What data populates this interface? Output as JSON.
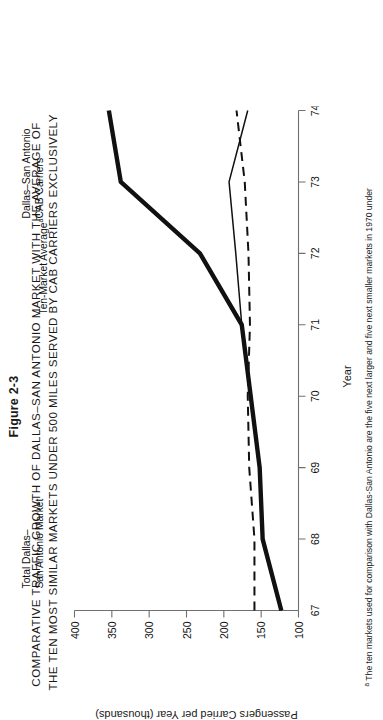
{
  "figure": {
    "number": "Figure 2-3",
    "title_lines": [
      "COMPARATIVE  TRAFFIC  GROWTH  OF  DALLAS–SAN ANTONIO  MARKET  WITH  THE  AVERAGE  OF",
      "THE TEN MOST SIMILAR  MARKETS  UNDER 500 MILES  SERVED  BY  CAB  CARRIERS  EXCLUSIVELY"
    ],
    "footnote_marker": "a",
    "footnote_text": " The ten markets used for comparison with Dallas-San Antonio are the five next larger and five next smaller markets in 1970 under"
  },
  "axes": {
    "x_title": "Year",
    "y_title": "Passengers Carried per Year (thousands)",
    "x_ticks": [
      "67",
      "68",
      "69",
      "70",
      "71",
      "72",
      "73",
      "74"
    ],
    "y_ticks": [
      "100",
      "150",
      "200",
      "250",
      "300",
      "350",
      "400"
    ]
  },
  "series_labels": {
    "total_market": "Total Dallas–\nSan Antonio Market",
    "total_market_l1": "Total Dallas–",
    "total_market_l2": "San Antonio Market",
    "ten_market_l1": "Ten-Market Average",
    "ten_market_sup": "a",
    "cab_l1": "Dallas–San Antonio",
    "cab_l2": "CAB Carriers"
  },
  "colors": {
    "ink": "#111111",
    "axis": "#6f6f6f",
    "background": "#ffffff"
  },
  "chart_data": {
    "type": "line",
    "title": "COMPARATIVE TRAFFIC GROWTH OF DALLAS–SAN ANTONIO MARKET WITH THE AVERAGE OF THE TEN MOST SIMILAR MARKETS UNDER 500 MILES SERVED BY CAB CARRIERS EXCLUSIVELY",
    "xlabel": "Year",
    "ylabel": "Passengers Carried per Year (thousands)",
    "x": [
      67,
      68,
      69,
      70,
      71,
      72,
      73,
      74
    ],
    "xlim": [
      67,
      74
    ],
    "ylim": [
      100,
      400
    ],
    "grid": false,
    "legend": "inline-labels",
    "series": [
      {
        "name": "Total Dallas–San Antonio Market",
        "style": "solid-thick",
        "values": [
          123,
          148,
          152,
          164,
          176,
          232,
          338,
          354
        ]
      },
      {
        "name": "Ten-Market Average",
        "style": "dashed",
        "values": [
          159,
          159,
          166,
          168,
          165,
          167,
          172,
          183
        ]
      },
      {
        "name": "Dallas–San Antonio CAB Carriers",
        "style": "solid-thin",
        "values": [
          123,
          148,
          152,
          164,
          176,
          184,
          193,
          168
        ]
      }
    ]
  }
}
